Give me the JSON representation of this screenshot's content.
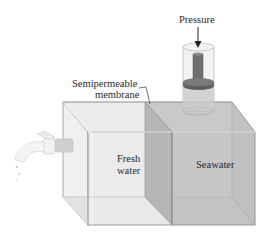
{
  "labels": {
    "pressure": "Pressure",
    "membrane_line1": "Semipermeable",
    "membrane_line2": "membrane",
    "fresh_line1": "Fresh",
    "fresh_line2": "water",
    "seawater": "Seawater"
  },
  "colors": {
    "fresh_side": "#e6e6e6",
    "fresh_front": "#ececec",
    "sea_side": "#bdbdbd",
    "sea_front": "#c4c4c4",
    "membrane": "#a9a9a9",
    "piston": "#6b6b6b",
    "outline": "#8a8a8a"
  }
}
